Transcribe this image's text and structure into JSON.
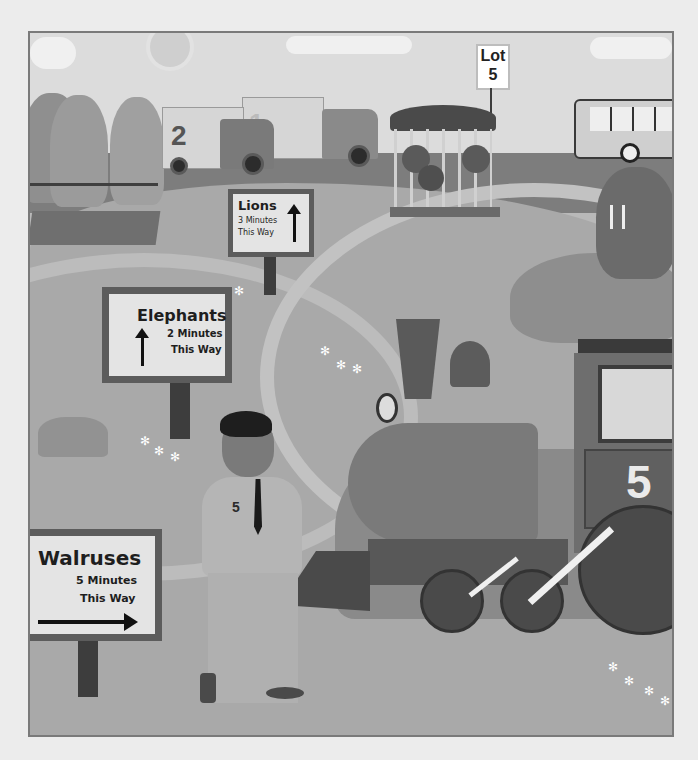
{
  "scene": {
    "description": "Illustrated zoo scene in grayscale with direction signs, a boy, and a steam train numbered 5",
    "colors": {
      "background": "#ececec",
      "frame_border": "#7a7a7a",
      "sign_face": "#e4e4e4",
      "sign_border": "#5c5c5c",
      "ground": "#a9a9a9"
    }
  },
  "signs": {
    "lot": {
      "line1": "Lot",
      "line2": "5"
    },
    "lions": {
      "title": "Lions",
      "time": "3 Minutes",
      "direction": "This Way",
      "arrow": "up"
    },
    "elephants": {
      "title": "Elephants",
      "time": "2 Minutes",
      "direction": "This Way",
      "arrow": "up"
    },
    "walruses": {
      "title": "Walruses",
      "time": "5 Minutes",
      "direction": "This Way",
      "arrow": "right"
    }
  },
  "vehicles": {
    "truck_front": {
      "number": "2"
    },
    "truck_back": {
      "number": "1"
    },
    "train": {
      "number": "5"
    },
    "bus": {
      "label": ""
    }
  },
  "characters": {
    "boy": {
      "shirt_number": "5"
    },
    "elephants_count": 3,
    "lions_count": 3,
    "walrus_count": 1
  },
  "icons": {
    "arrow_up": "↑",
    "arrow_right": "→",
    "flower": "✻"
  }
}
